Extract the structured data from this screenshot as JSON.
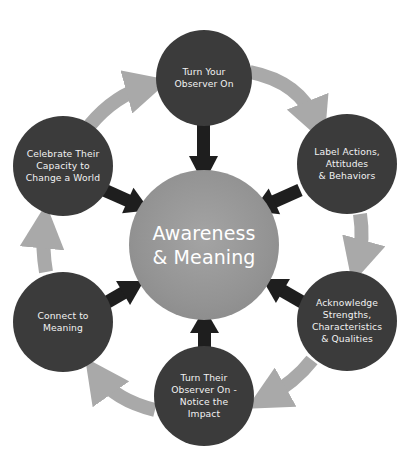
{
  "diagram": {
    "center": {
      "label": "Awareness\n& Meaning"
    },
    "nodes": [
      {
        "id": "top",
        "label": "Turn Your\nObserver On"
      },
      {
        "id": "upper-right",
        "label": "Label Actions,\nAttitudes\n& Behaviors"
      },
      {
        "id": "lower-right",
        "label": "Acknowledge\nStrengths,\nCharacteristics\n& Qualities"
      },
      {
        "id": "bottom",
        "label": "Turn Their\nObserver On -\nNotice the\nImpact"
      },
      {
        "id": "lower-left",
        "label": "Connect to\nMeaning"
      },
      {
        "id": "upper-left",
        "label": "Celebrate Their\nCapacity to\nChange a World"
      }
    ],
    "colors": {
      "outer_node": "#3b3b3b",
      "center_node": "#959595",
      "cycle_arrow": "#a9a9a9",
      "spoke_arrow": "#1e1e1e",
      "text": "#f2f2f2"
    }
  }
}
